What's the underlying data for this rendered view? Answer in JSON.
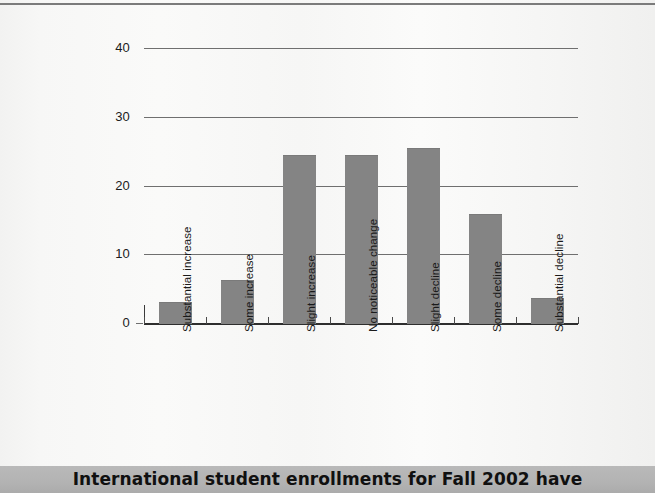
{
  "page": {
    "caption": "International student enrollments for Fall 2002 have"
  },
  "chart_data": {
    "type": "bar",
    "title": "",
    "xlabel": "",
    "ylabel": "",
    "categories": [
      "Substantial increase",
      "Some increase",
      "Slight increase",
      "No noticeable change",
      "Slight decline",
      "Some decline",
      "Substantial decline"
    ],
    "values": [
      3.0,
      6.3,
      24.5,
      24.5,
      25.5,
      15.8,
      3.6
    ],
    "ylim": [
      0,
      42
    ],
    "yticks": [
      0,
      10,
      20,
      30,
      40
    ],
    "ytick_labels": [
      "0",
      "10",
      "20",
      "30",
      "40"
    ],
    "grid": true,
    "legend": false,
    "bar_color": "#848484",
    "axis_color": "#2e2e2e",
    "grid_color": "#6f6f6f",
    "background": "#f7f7f6"
  }
}
